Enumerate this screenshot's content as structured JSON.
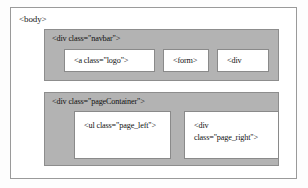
{
  "diagram": {
    "type": "html-structure-box-diagram",
    "root": {
      "label": "<body>"
    },
    "blocks": [
      {
        "name": "navbar",
        "label": "<div class=\"navbar\">",
        "children": [
          {
            "name": "logo",
            "label": "<a class=\"logo\">"
          },
          {
            "name": "form",
            "label": "<form>"
          },
          {
            "name": "navbar-div",
            "label": "<div"
          }
        ]
      },
      {
        "name": "pageContainer",
        "label": "<div class=\"pageContainer\">",
        "children": [
          {
            "name": "page-left",
            "label": "<ul class=\"page_left\">"
          },
          {
            "name": "page-right",
            "label": "<div\nclass=\"page_right\">"
          }
        ]
      }
    ],
    "colors": {
      "container_fill": "#b3b3b3",
      "container_border": "#8d8d8d",
      "box_fill": "#ffffff",
      "box_border": "#8a8a8a",
      "frame_border": "#9a9a9a",
      "text": "#111111",
      "background": "#fdfdfd"
    }
  }
}
